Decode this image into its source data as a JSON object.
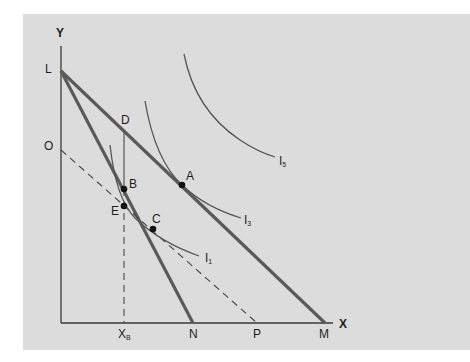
{
  "diagram": {
    "axes": {
      "x_label": "X",
      "y_label": "Y"
    },
    "intercepts": {
      "L": "L",
      "O": "O",
      "N": "N",
      "P": "P",
      "M": "M",
      "XB_main": "X",
      "XB_sub": "B"
    },
    "points": {
      "A": "A",
      "B": "B",
      "C": "C",
      "D": "D",
      "E": "E"
    },
    "curves": {
      "I1_main": "I",
      "I1_sub": "1",
      "I3_main": "I",
      "I3_sub": "3",
      "I5_main": "I",
      "I5_sub": "5"
    },
    "colors": {
      "panel_bg": "#dcdcdc",
      "budget_line": "#5a5a5a",
      "curve": "#555555",
      "axis": "#3a3a3a",
      "point": "#111111"
    }
  }
}
